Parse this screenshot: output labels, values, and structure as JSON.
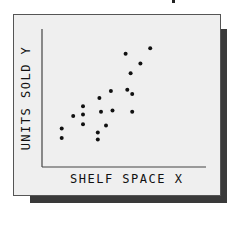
{
  "chart_data": {
    "type": "scatter",
    "title": "",
    "xlabel": "SHELF SPACE X",
    "ylabel": "UNITS SOLD Y",
    "grid": false,
    "legend": null,
    "xlim": [
      0,
      100
    ],
    "ylim": [
      0,
      100
    ],
    "ticks": "none",
    "points": [
      {
        "x": 12,
        "y": 28
      },
      {
        "x": 12,
        "y": 21
      },
      {
        "x": 19,
        "y": 37
      },
      {
        "x": 25,
        "y": 44
      },
      {
        "x": 25,
        "y": 38
      },
      {
        "x": 25,
        "y": 31
      },
      {
        "x": 34,
        "y": 25
      },
      {
        "x": 34,
        "y": 20
      },
      {
        "x": 35,
        "y": 50
      },
      {
        "x": 36,
        "y": 40
      },
      {
        "x": 39,
        "y": 30
      },
      {
        "x": 42,
        "y": 55
      },
      {
        "x": 43,
        "y": 41
      },
      {
        "x": 51,
        "y": 82
      },
      {
        "x": 52,
        "y": 56
      },
      {
        "x": 54,
        "y": 68
      },
      {
        "x": 55,
        "y": 53
      },
      {
        "x": 55,
        "y": 40
      },
      {
        "x": 60,
        "y": 75
      },
      {
        "x": 66,
        "y": 86
      }
    ]
  },
  "colors": {
    "frame_bg": "#efefef",
    "shadow": "#3a3a3a",
    "ink": "#111111"
  },
  "labels": {
    "x_axis": "SHELF SPACE X",
    "y_axis": "UNITS SOLD Y"
  }
}
